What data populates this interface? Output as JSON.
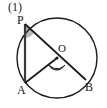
{
  "figure": {
    "number_label": "(1)",
    "type": "circle-geometry-diagram",
    "background_color": "#ffffff",
    "stroke_color": "#1a1a1a",
    "shade_color": "#b4b4b4",
    "points": {
      "P": {
        "label": "P",
        "x": 25,
        "y": 24
      },
      "O": {
        "label": "O",
        "x": 57,
        "y": 58
      },
      "A": {
        "label": "A",
        "x": 25,
        "y": 83
      },
      "B": {
        "label": "B",
        "x": 86,
        "y": 80
      }
    },
    "circle": {
      "cx": 57,
      "cy": 58,
      "r": 40
    },
    "segments": [
      {
        "name": "PA",
        "from": "P",
        "to": "A"
      },
      {
        "name": "PB",
        "from": "P",
        "to": "B"
      },
      {
        "name": "AO",
        "from": "A",
        "to": "O"
      }
    ],
    "angle_marks": [
      {
        "name": "angle-P",
        "at": "P",
        "style": "shaded-wedge"
      },
      {
        "name": "angle-AOB",
        "at": "O",
        "style": "double-arc"
      }
    ]
  }
}
